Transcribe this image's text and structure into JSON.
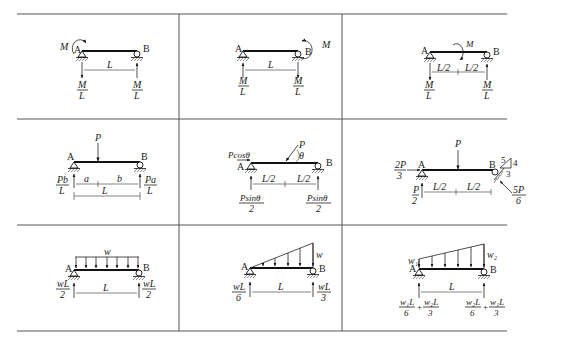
{
  "table": {
    "rows": 3,
    "columns": 3,
    "cells": [
      {
        "id": "moment-at-A",
        "supports": {
          "left": "A",
          "right": "B"
        },
        "load": {
          "type": "moment",
          "label": "M",
          "at": "A"
        },
        "span": "L",
        "reactions": {
          "left": {
            "num": "M",
            "den": "L",
            "dir": "down"
          },
          "right": {
            "num": "M",
            "den": "L",
            "dir": "up"
          }
        }
      },
      {
        "id": "moment-at-B",
        "supports": {
          "left": "A",
          "right": "B"
        },
        "load": {
          "type": "moment",
          "label": "M",
          "at": "B"
        },
        "span": "L",
        "reactions": {
          "left": {
            "num": "M",
            "den": "L",
            "dir": "up"
          },
          "right": {
            "num": "M",
            "den": "L",
            "dir": "down"
          }
        }
      },
      {
        "id": "moment-at-midspan",
        "supports": {
          "left": "A",
          "right": "B"
        },
        "load": {
          "type": "moment",
          "label": "M",
          "at": "midspan"
        },
        "spans": [
          "L/2",
          "L/2"
        ],
        "reactions": {
          "left": {
            "num": "M",
            "den": "L",
            "dir": "down"
          },
          "right": {
            "num": "M",
            "den": "L",
            "dir": "up"
          }
        }
      },
      {
        "id": "point-load-offset",
        "supports": {
          "left": "A",
          "right": "B"
        },
        "load": {
          "type": "point",
          "label": "P"
        },
        "spans": [
          "a",
          "b"
        ],
        "span_total": "L",
        "reactions": {
          "left": {
            "num": "Pb",
            "den": "L",
            "dir": "up"
          },
          "right": {
            "num": "Pa",
            "den": "L",
            "dir": "up"
          }
        }
      },
      {
        "id": "inclined-point-load",
        "supports": {
          "left": "A",
          "right": "B"
        },
        "load": {
          "type": "inclined-point",
          "label": "P",
          "angle": "θ"
        },
        "horizontal_reaction": "Pcosθ",
        "spans": [
          "L/2",
          "L/2"
        ],
        "reactions": {
          "left": {
            "num": "Psinθ",
            "den": "2",
            "dir": "up"
          },
          "right": {
            "num": "Psinθ",
            "den": "2",
            "dir": "up"
          }
        }
      },
      {
        "id": "inclined-roller-support",
        "supports": {
          "left": "A",
          "right": "B"
        },
        "load": {
          "type": "point",
          "label": "P"
        },
        "slope": {
          "hyp": "5",
          "rise": "4",
          "run": "3"
        },
        "horizontal_reaction": {
          "num": "2P",
          "den": "3"
        },
        "spans": [
          "L/2",
          "L/2"
        ],
        "reactions": {
          "left": {
            "num": "P",
            "den": "2",
            "dir": "up"
          },
          "right": {
            "num": "5P",
            "den": "6",
            "dir": "inclined"
          }
        }
      },
      {
        "id": "uniform-load",
        "supports": {
          "left": "A",
          "right": "B"
        },
        "load": {
          "type": "uniform",
          "label": "w"
        },
        "span": "L",
        "reactions": {
          "left": {
            "num": "wL",
            "den": "2",
            "dir": "up"
          },
          "right": {
            "num": "wL",
            "den": "2",
            "dir": "up"
          }
        }
      },
      {
        "id": "triangular-load",
        "supports": {
          "left": "A",
          "right": "B"
        },
        "load": {
          "type": "triangular",
          "label": "w"
        },
        "span": "L",
        "reactions": {
          "left": {
            "num": "wL",
            "den": "6",
            "dir": "up"
          },
          "right": {
            "num": "wL",
            "den": "3",
            "dir": "up"
          }
        }
      },
      {
        "id": "trapezoidal-load",
        "supports": {
          "left": "A",
          "right": "B"
        },
        "load": {
          "type": "trapezoidal",
          "label_left": "w₁",
          "label_right": "w₂"
        },
        "span": "L",
        "reactions": {
          "left": {
            "terms": [
              {
                "num": "w₁L",
                "den": "6"
              },
              {
                "num": "w₂L",
                "den": "3"
              }
            ],
            "op": "+",
            "dir": "up"
          },
          "right": {
            "terms": [
              {
                "num": "w₂L",
                "den": "6"
              },
              {
                "num": "w₁L",
                "den": "3"
              }
            ],
            "op": "+",
            "dir": "up"
          }
        }
      }
    ]
  },
  "colors": {
    "line": "#111111",
    "grid": "#555555",
    "background": "#ffffff"
  }
}
